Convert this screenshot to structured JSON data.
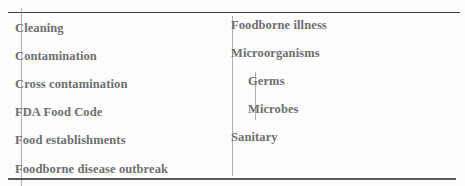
{
  "document": {
    "type": "key-terms-list",
    "columns": [
      {
        "terms": [
          {
            "label": "Cleaning",
            "indent": false
          },
          {
            "label": "Contamination",
            "indent": false
          },
          {
            "label": "Cross contamination",
            "indent": false
          },
          {
            "label": "FDA Food Code",
            "indent": false
          },
          {
            "label": "Food establishments",
            "indent": false
          },
          {
            "label": "Foodborne disease outbreak",
            "indent": false
          }
        ]
      },
      {
        "terms": [
          {
            "label": "Foodborne illness",
            "indent": false
          },
          {
            "label": "Microorganisms",
            "indent": false
          },
          {
            "label": "Germs",
            "indent": true
          },
          {
            "label": "Microbes",
            "indent": true
          },
          {
            "label": "Sanitary",
            "indent": false
          }
        ]
      }
    ]
  },
  "colors": {
    "text": "#6e6e6e",
    "rule": "#3a3a3a",
    "background": "#fdfdfd"
  }
}
